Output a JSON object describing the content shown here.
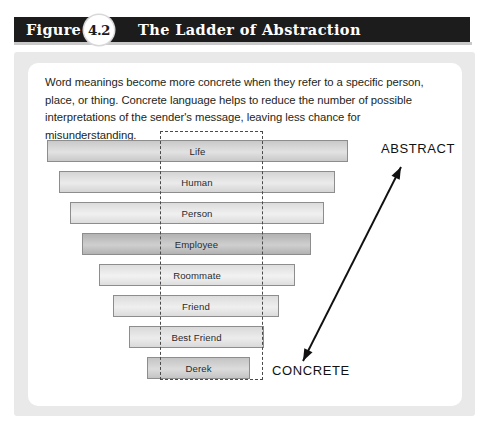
{
  "figure": {
    "label_word": "Figure",
    "number": "4.2",
    "title": "The Ladder of Abstraction"
  },
  "intro": {
    "text": "Word meanings become more concrete when they refer to a specific person, place, or thing. Concrete language helps to reduce the number of possible interpretations of the sender's message, leaving less chance for misunderstanding."
  },
  "diagram": {
    "type": "ladder",
    "axis_labels": {
      "top": "ABSTRACT",
      "bottom": "CONCRETE"
    },
    "rungs": [
      {
        "label": "Life",
        "left": 47,
        "top": 140,
        "width": 301,
        "height": 22,
        "fill_start": "#c9c9c9",
        "fill_end": "#e2e2e2"
      },
      {
        "label": "Human",
        "left": 59,
        "top": 171,
        "width": 276,
        "height": 22,
        "fill_start": "#d5d5d5",
        "fill_end": "#ebebeb"
      },
      {
        "label": "Person",
        "left": 70,
        "top": 202,
        "width": 254,
        "height": 22,
        "fill_start": "#dcdcdc",
        "fill_end": "#f0f0f0"
      },
      {
        "label": "Employee",
        "left": 82,
        "top": 233,
        "width": 229,
        "height": 22,
        "fill_start": "#b2b2b2",
        "fill_end": "#cfcfcf"
      },
      {
        "label": "Roommate",
        "left": 99,
        "top": 264,
        "width": 196,
        "height": 22,
        "fill_start": "#dedede",
        "fill_end": "#f2f2f2"
      },
      {
        "label": "Friend",
        "left": 113,
        "top": 295,
        "width": 166,
        "height": 22,
        "fill_start": "#dcdcdc",
        "fill_end": "#efefef"
      },
      {
        "label": "Best Friend",
        "left": 129,
        "top": 326,
        "width": 135,
        "height": 22,
        "fill_start": "#d9d9d9",
        "fill_end": "#ececec"
      },
      {
        "label": "Derek",
        "left": 147,
        "top": 357,
        "width": 103,
        "height": 22,
        "fill_start": "#c4c4c4",
        "fill_end": "#dcdcdc"
      }
    ],
    "focus_box": {
      "left": 160,
      "top": 131,
      "width": 103,
      "height": 249
    },
    "arrow": {
      "x1": 401,
      "y1": 167,
      "x2": 303,
      "y2": 361,
      "double_headed": true,
      "color": "#111111"
    }
  },
  "colors": {
    "header_bar": "#1c1c1c",
    "outer_panel": "#e9e9e9",
    "inner_card": "#ffffff",
    "text": "#231f20",
    "rung_border": "#8d8d8d",
    "dashed": "#4a4a4a"
  }
}
